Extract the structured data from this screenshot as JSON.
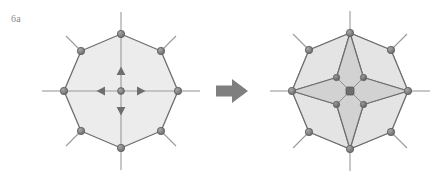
{
  "figure": {
    "panel_label": "6a",
    "background_color": "#ffffff",
    "caption_color": "#8a8a8a"
  },
  "palette": {
    "outline": "#6e6e6e",
    "outline_light": "#9a9a9a",
    "node_fill": "#7a7a7a",
    "node_stroke": "#5f5f5f",
    "face_fill_outer": "#ececec",
    "face_fill_petal": "#e6e6e6",
    "face_fill_star": "#d2d2d2",
    "arrow_fill": "#7f7f7f",
    "axis_line": "#9a9a9a",
    "spoke_line": "#8f8f8f"
  },
  "transition_arrow": {
    "icon": "right-arrow-icon",
    "direction": "right",
    "cx": 232,
    "cy": 91,
    "color": "#7f7f7f"
  },
  "left_figure": {
    "name": "octagon-relaxed",
    "center": {
      "x": 121,
      "y": 91
    },
    "vertex_radius": 57,
    "spoke_extension": 22,
    "node_radius": 3.6,
    "vertex_count": 8,
    "vertex_angles_deg": [
      270,
      315,
      0,
      45,
      90,
      135,
      180,
      225
    ],
    "vertices": [
      {
        "id": "v-top",
        "x": 121,
        "y": 34
      },
      {
        "id": "v-top-right",
        "x": 161,
        "y": 51
      },
      {
        "id": "v-right",
        "x": 178,
        "y": 91
      },
      {
        "id": "v-bottom-right",
        "x": 161,
        "y": 131
      },
      {
        "id": "v-bottom",
        "x": 121,
        "y": 148
      },
      {
        "id": "v-bottom-left",
        "x": 81,
        "y": 131
      },
      {
        "id": "v-left",
        "x": 64,
        "y": 91
      },
      {
        "id": "v-top-left",
        "x": 81,
        "y": 51
      }
    ],
    "spoke_tips": [
      {
        "id": "s-top",
        "x": 121,
        "y": 12
      },
      {
        "id": "s-top-right",
        "x": 176,
        "y": 36
      },
      {
        "id": "s-right",
        "x": 200,
        "y": 91
      },
      {
        "id": "s-bottom-right",
        "x": 176,
        "y": 146
      },
      {
        "id": "s-bottom",
        "x": 121,
        "y": 170
      },
      {
        "id": "s-bottom-left",
        "x": 66,
        "y": 146
      },
      {
        "id": "s-left",
        "x": 42,
        "y": 91
      },
      {
        "id": "s-top-left",
        "x": 66,
        "y": 36
      }
    ],
    "center_node": {
      "x": 121,
      "y": 91,
      "r": 3.4
    },
    "force_arrows": [
      {
        "id": "force-arrow-up",
        "direction": "up",
        "tip_x": 121,
        "tip_y": 67
      },
      {
        "id": "force-arrow-right",
        "direction": "right",
        "tip_x": 145,
        "tip_y": 91
      },
      {
        "id": "force-arrow-down",
        "direction": "down",
        "tip_x": 121,
        "tip_y": 115
      },
      {
        "id": "force-arrow-left",
        "direction": "left",
        "tip_x": 97,
        "tip_y": 91
      }
    ]
  },
  "right_figure": {
    "name": "octagon-collapsed-star",
    "center": {
      "x": 350,
      "y": 91
    },
    "vertex_radius": 58,
    "spoke_extension": 22,
    "node_radius": 3.6,
    "vertex_count": 8,
    "star_inner_radius": 19,
    "star_point_radius": 40,
    "vertices": [
      {
        "id": "v-top",
        "x": 350,
        "y": 33
      },
      {
        "id": "v-top-right",
        "x": 391,
        "y": 50
      },
      {
        "id": "v-right",
        "x": 408,
        "y": 91
      },
      {
        "id": "v-bottom-right",
        "x": 391,
        "y": 132
      },
      {
        "id": "v-bottom",
        "x": 350,
        "y": 149
      },
      {
        "id": "v-bottom-left",
        "x": 309,
        "y": 132
      },
      {
        "id": "v-left",
        "x": 292,
        "y": 91
      },
      {
        "id": "v-top-left",
        "x": 309,
        "y": 50
      }
    ],
    "spoke_tips": [
      {
        "id": "s-top",
        "x": 350,
        "y": 11
      },
      {
        "id": "s-top-right",
        "x": 407,
        "y": 34
      },
      {
        "id": "s-right",
        "x": 430,
        "y": 91
      },
      {
        "id": "s-bottom-right",
        "x": 407,
        "y": 148
      },
      {
        "id": "s-bottom",
        "x": 350,
        "y": 171
      },
      {
        "id": "s-bottom-left",
        "x": 293,
        "y": 148
      },
      {
        "id": "s-left",
        "x": 270,
        "y": 91
      },
      {
        "id": "s-top-left",
        "x": 293,
        "y": 34
      }
    ],
    "center_node": {
      "x": 350,
      "y": 91,
      "r": 4.0
    },
    "star_concave_nodes": [
      {
        "id": "star-node-top-right",
        "x": 363.5,
        "y": 77.5
      },
      {
        "id": "star-node-bottom-right",
        "x": 363.5,
        "y": 104.5
      },
      {
        "id": "star-node-bottom-left",
        "x": 336.5,
        "y": 104.5
      },
      {
        "id": "star-node-top-left",
        "x": 336.5,
        "y": 77.5
      }
    ],
    "star_tips": [
      {
        "id": "star-tip-top",
        "x": 350,
        "y": 33
      },
      {
        "id": "star-tip-right",
        "x": 408,
        "y": 91
      },
      {
        "id": "star-tip-bottom",
        "x": 350,
        "y": 149
      },
      {
        "id": "star-tip-left",
        "x": 292,
        "y": 91
      }
    ]
  }
}
